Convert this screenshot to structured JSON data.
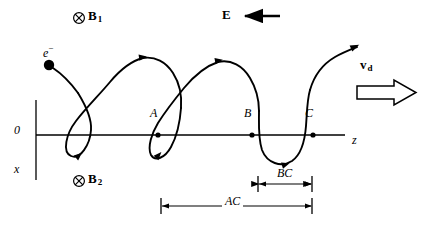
{
  "figure": {
    "type": "physics-trajectory-diagram",
    "stroke_color": "#000000",
    "background_color": "#ffffff"
  },
  "axes": {
    "origin_label": "0",
    "vertical_axis_label": "x",
    "horizontal_axis_label": "z",
    "origin_px": {
      "x": 36,
      "y": 135
    },
    "horizontal_line": {
      "x1": 36,
      "x2": 345,
      "y": 135
    },
    "vertical_line": {
      "x": 36,
      "y1": 100,
      "y2": 180
    }
  },
  "fields": {
    "magnetic_top": {
      "symbol": "⊗",
      "icon": "circle-cross-into-page-icon",
      "label": "B",
      "subscript": "1"
    },
    "magnetic_bottom": {
      "symbol": "⊗",
      "icon": "circle-cross-into-page-icon",
      "label": "B",
      "subscript": "2"
    },
    "electric": {
      "label": "E",
      "direction": "left",
      "arrow": {
        "x_tail": 280,
        "x_head": 243,
        "y": 16
      }
    },
    "drift_velocity": {
      "label": "v",
      "subscript": "d",
      "direction": "right",
      "arrow_style": "hollow-block-arrow",
      "arrow": {
        "x_tail": 357,
        "x_head": 415,
        "y": 92
      }
    }
  },
  "particle": {
    "symbol": "e",
    "charge_superscript": "−",
    "marker": "filled-circle",
    "start_px": {
      "x": 49,
      "y": 65
    },
    "marker_radius": 5
  },
  "trajectory": {
    "kind": "prolate-cycloid",
    "description": "Electron follows a looping trochoid drifting in the +z direction",
    "arrow_count": 5,
    "loop_count": 3
  },
  "points": [
    {
      "label": "A",
      "x": 158,
      "y": 135
    },
    {
      "label": "B",
      "x": 252,
      "y": 135
    },
    {
      "label": "C",
      "x": 313,
      "y": 135
    }
  ],
  "dimensions": [
    {
      "label": "BC",
      "x1": 258,
      "x2": 312,
      "y": 184,
      "tick_top": 177,
      "tick_bottom": 191
    },
    {
      "label": "AC",
      "x1": 161,
      "x2": 312,
      "y": 206,
      "tick_top": 198,
      "tick_bottom": 214
    }
  ]
}
